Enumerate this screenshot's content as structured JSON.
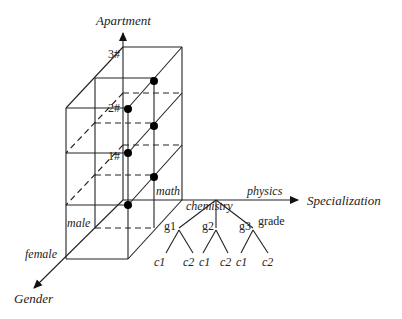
{
  "axes": {
    "vertical": "Apartment",
    "horizontal": "Specialization",
    "depth": "Gender"
  },
  "apartment_levels": [
    "1#",
    "2#",
    "3#"
  ],
  "specialization_values": [
    "math",
    "chemistry",
    "physics"
  ],
  "gender_values": [
    "male",
    "female"
  ],
  "hierarchy": {
    "label": "grade",
    "nodes": [
      {
        "name": "g1",
        "children": [
          "c1",
          "c2"
        ]
      },
      {
        "name": "g2",
        "children": [
          "c1",
          "c2"
        ]
      },
      {
        "name": "g3",
        "children": [
          "c1",
          "c2"
        ]
      }
    ]
  }
}
